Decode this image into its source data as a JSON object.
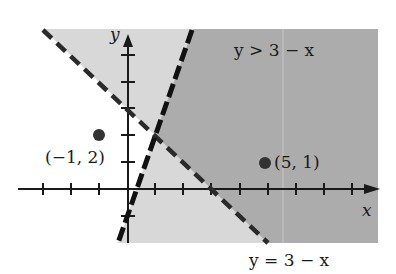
{
  "figure": {
    "type": "linear-inequality-graph",
    "region_label": "y > 3 − x",
    "boundary_label": "y = 3 − x",
    "x_axis_label": "x",
    "y_axis_label": "y",
    "points": [
      {
        "label": "(−1, 2)",
        "x": -1,
        "y": 2
      },
      {
        "label": "(5, 1)",
        "x": 5,
        "y": 1
      }
    ],
    "lines": [
      {
        "equation": "y = 3 − x",
        "style": "dashed"
      },
      {
        "equation": "y = 3x − 1",
        "style": "dashed"
      }
    ],
    "colors": {
      "dark_region": "#a9a9a9",
      "light_region": "#d6d6d6",
      "ink": "#1a1a1a"
    }
  }
}
